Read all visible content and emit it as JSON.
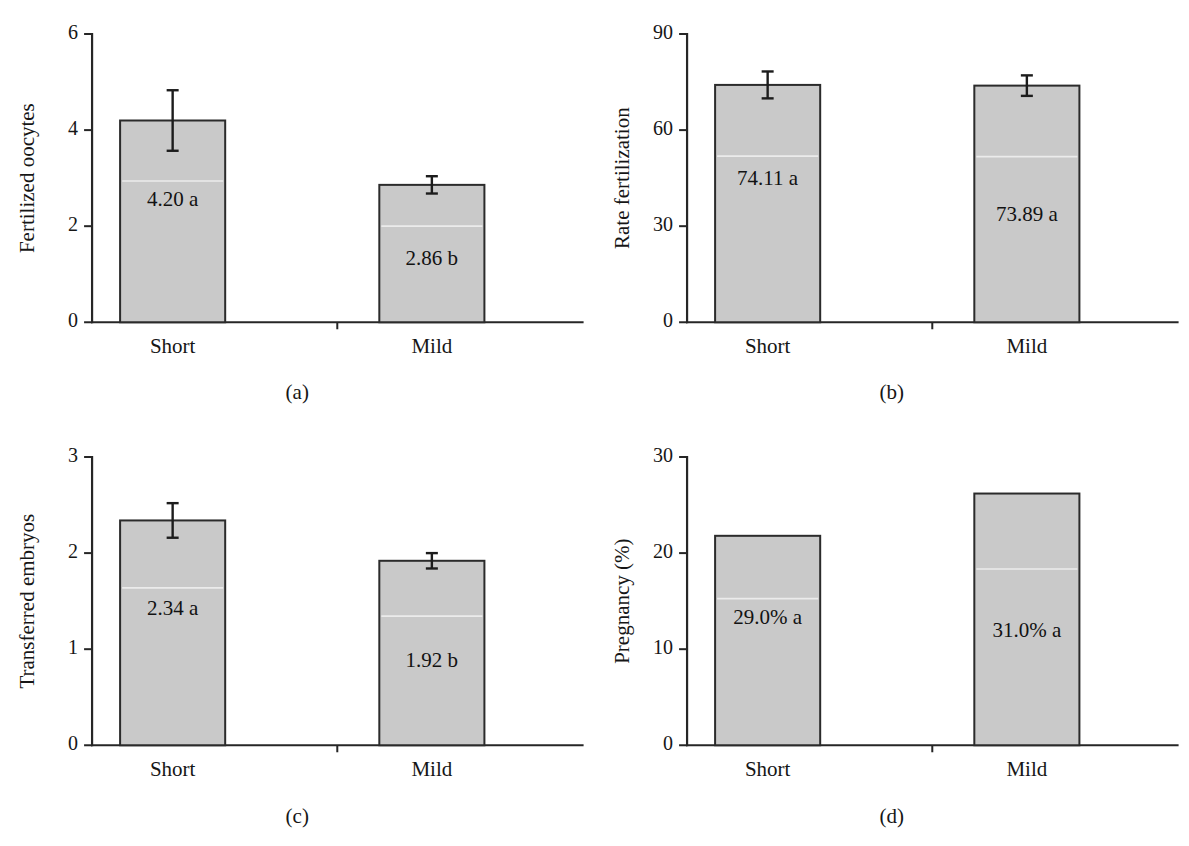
{
  "figure": {
    "panel_count": 4,
    "bar_fill_color": "#c9c9c9",
    "bar_edge_color": "#2b2b2b",
    "text_color": "#161616",
    "background_color": "#ffffff"
  },
  "panels": [
    {
      "key": "a",
      "subcaption": "(a)",
      "ylabel": "Fertilized oocytes",
      "categories": [
        "Short",
        "Mild"
      ],
      "yticks": [
        "0",
        "2",
        "4",
        "6"
      ],
      "bar_labels": [
        "4.20 a",
        "2.86 b"
      ]
    },
    {
      "key": "b",
      "subcaption": "(b)",
      "ylabel": "Rate fertilization",
      "categories": [
        "Short",
        "Mild"
      ],
      "yticks": [
        "0",
        "30",
        "60",
        "90"
      ],
      "bar_labels": [
        "74.11 a",
        "73.89 a"
      ]
    },
    {
      "key": "c",
      "subcaption": "(c)",
      "ylabel": "Transferred embryos",
      "categories": [
        "Short",
        "Mild"
      ],
      "yticks": [
        "0",
        "1",
        "2",
        "3"
      ],
      "bar_labels": [
        "2.34 a",
        "1.92 b"
      ]
    },
    {
      "key": "d",
      "subcaption": "(d)",
      "ylabel": "Pregnancy (%)",
      "categories": [
        "Short",
        "Mild"
      ],
      "yticks": [
        "0",
        "10",
        "20",
        "30"
      ],
      "bar_labels": [
        "29.0% a",
        "31.0% a"
      ]
    }
  ],
  "chart_data": [
    {
      "type": "bar",
      "panel": "a",
      "title": "",
      "xlabel": "",
      "ylabel": "Fertilized oocytes",
      "categories": [
        "Short",
        "Mild"
      ],
      "values": [
        4.2,
        2.86
      ],
      "errors": [
        0.63,
        0.18
      ],
      "data_labels": [
        "4.20 a",
        "2.86 b"
      ],
      "significance_letters": [
        "a",
        "b"
      ],
      "ylim": [
        0,
        6
      ],
      "yticks": [
        0,
        2,
        4,
        6
      ],
      "grid": false,
      "legend": "none"
    },
    {
      "type": "bar",
      "panel": "b",
      "title": "",
      "xlabel": "",
      "ylabel": "Rate fertilization",
      "categories": [
        "Short",
        "Mild"
      ],
      "values": [
        74.11,
        73.89
      ],
      "errors": [
        4.2,
        3.2
      ],
      "data_labels": [
        "74.11 a",
        "73.89 a"
      ],
      "significance_letters": [
        "a",
        "a"
      ],
      "ylim": [
        0,
        90
      ],
      "yticks": [
        0,
        30,
        60,
        90
      ],
      "grid": false,
      "legend": "none"
    },
    {
      "type": "bar",
      "panel": "c",
      "title": "",
      "xlabel": "",
      "ylabel": "Transferred embryos",
      "categories": [
        "Short",
        "Mild"
      ],
      "values": [
        2.34,
        1.92
      ],
      "errors": [
        0.18,
        0.08
      ],
      "data_labels": [
        "2.34 a",
        "1.92 b"
      ],
      "significance_letters": [
        "a",
        "b"
      ],
      "ylim": [
        0,
        3
      ],
      "yticks": [
        0,
        1,
        2,
        3
      ],
      "grid": false,
      "legend": "none"
    },
    {
      "type": "bar",
      "panel": "d",
      "title": "",
      "xlabel": "",
      "ylabel": "Pregnancy (%)",
      "categories": [
        "Short",
        "Mild"
      ],
      "values": [
        21.8,
        26.2
      ],
      "errors": [
        0,
        0
      ],
      "data_labels": [
        "29.0% a",
        "31.0% a"
      ],
      "significance_letters": [
        "a",
        "a"
      ],
      "ylim": [
        0,
        30
      ],
      "yticks": [
        0,
        10,
        20,
        30
      ],
      "grid": false,
      "legend": "none"
    }
  ]
}
